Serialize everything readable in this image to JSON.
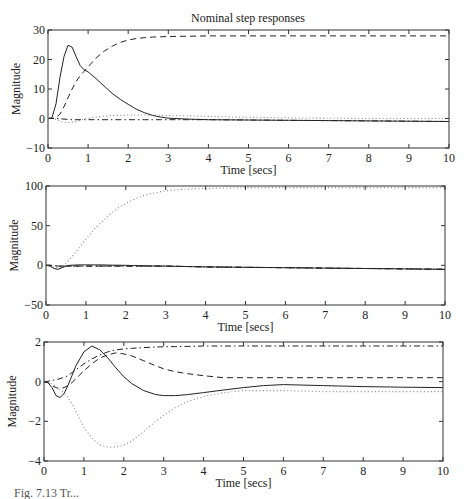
{
  "figure": {
    "title": "Nominal step responses",
    "caption_fragment": "Fig. 7.13  Tr..."
  },
  "colors": {
    "line": "#222222",
    "axis": "#333333",
    "dotted": "#888888"
  },
  "chart_data": [
    {
      "type": "line",
      "title": "Nominal step responses",
      "xlabel": "Time [secs]",
      "ylabel": "Magnitude",
      "xlim": [
        0,
        10
      ],
      "ylim": [
        -10,
        30
      ],
      "xticks": [
        0,
        1,
        2,
        3,
        4,
        5,
        6,
        7,
        8,
        9,
        10
      ],
      "yticks": [
        -10,
        0,
        10,
        20,
        30
      ],
      "grid": false,
      "box": {
        "left": 48,
        "top": 30,
        "right": 449,
        "bottom": 148
      },
      "x": [
        0,
        0.1,
        0.2,
        0.3,
        0.4,
        0.5,
        0.6,
        0.7,
        0.8,
        0.9,
        1.0,
        1.2,
        1.4,
        1.6,
        1.8,
        2.0,
        2.2,
        2.4,
        2.6,
        2.8,
        3.0,
        3.5,
        4,
        5,
        6,
        7,
        8,
        9,
        10
      ],
      "series": [
        {
          "name": "solid",
          "style": "solid",
          "values": [
            0,
            0.3,
            5,
            14,
            21,
            24.8,
            24.2,
            21,
            18,
            16.5,
            15.8,
            13.5,
            11,
            8.5,
            6.5,
            4.8,
            3.2,
            2,
            1.1,
            0.5,
            0.1,
            -0.2,
            -0.4,
            -0.5,
            -0.6,
            -0.7,
            -0.8,
            -0.9,
            -1
          ]
        },
        {
          "name": "dashed",
          "style": "dashed",
          "values": [
            0,
            0,
            0.3,
            1.5,
            4,
            7,
            10,
            12.5,
            14.5,
            16,
            17.5,
            20.5,
            22.8,
            24.5,
            25.8,
            26.6,
            27.1,
            27.4,
            27.6,
            27.7,
            27.8,
            27.9,
            28,
            28,
            28,
            28,
            28,
            28,
            28
          ]
        },
        {
          "name": "dotted",
          "style": "dotted",
          "values": [
            0,
            0,
            -0.3,
            -0.8,
            -1.3,
            -1.4,
            -1.3,
            -1,
            -0.6,
            -0.2,
            0.1,
            0.5,
            0.8,
            1,
            1.1,
            1.2,
            1.2,
            1.2,
            1.1,
            1.1,
            1,
            0.9,
            0.7,
            0.4,
            0.2,
            0.1,
            0,
            0,
            0
          ]
        },
        {
          "name": "dashdot",
          "style": "dashdot",
          "values": [
            0,
            0,
            0,
            -0.1,
            -0.2,
            -0.3,
            -0.4,
            -0.4,
            -0.4,
            -0.4,
            -0.4,
            -0.4,
            -0.4,
            -0.4,
            -0.4,
            -0.4,
            -0.4,
            -0.4,
            -0.4,
            -0.4,
            -0.4,
            -0.4,
            -0.4,
            -0.5,
            -0.6,
            -0.7,
            -0.8,
            -0.9,
            -1
          ]
        }
      ]
    },
    {
      "type": "line",
      "title": "",
      "xlabel": "Time [secs]",
      "ylabel": "Magnitude",
      "xlim": [
        0,
        10
      ],
      "ylim": [
        -50,
        100
      ],
      "xticks": [
        0,
        1,
        2,
        3,
        4,
        5,
        6,
        7,
        8,
        9,
        10
      ],
      "yticks": [
        -50,
        0,
        50,
        100
      ],
      "grid": false,
      "box": {
        "left": 46,
        "top": 186,
        "right": 445,
        "bottom": 305
      },
      "x": [
        0,
        0.1,
        0.2,
        0.3,
        0.4,
        0.5,
        0.6,
        0.8,
        1.0,
        1.2,
        1.4,
        1.6,
        1.8,
        2.0,
        2.2,
        2.4,
        2.6,
        2.8,
        3.0,
        3.5,
        4,
        5,
        6,
        7,
        8,
        9,
        10
      ],
      "series": [
        {
          "name": "solid",
          "style": "solid",
          "values": [
            0,
            -1,
            -4,
            -5,
            -3,
            -1,
            0,
            0.5,
            0.5,
            0.5,
            0.5,
            0.3,
            0.2,
            0,
            -0.3,
            -0.5,
            -0.7,
            -0.9,
            -1,
            -1.5,
            -2,
            -2.5,
            -3,
            -3.5,
            -4,
            -4.5,
            -5
          ]
        },
        {
          "name": "dashed",
          "style": "dashed",
          "values": [
            0,
            0,
            -0.5,
            -1,
            -1,
            -1,
            -1,
            -1,
            -1,
            -1,
            -1,
            -1,
            -1,
            -1,
            -1,
            -1,
            -1,
            -1,
            -1,
            -1.5,
            -2,
            -2.5,
            -3,
            -3.5,
            -4,
            -4.5,
            -5
          ]
        },
        {
          "name": "dotted",
          "style": "dotted",
          "values": [
            0,
            0,
            -2,
            -3,
            -2,
            2,
            8,
            20,
            33,
            45,
            55,
            64,
            72,
            78,
            83,
            87,
            90,
            92,
            94,
            96,
            97,
            98,
            98,
            98,
            98,
            98,
            98
          ]
        },
        {
          "name": "dashdot",
          "style": "dashdot",
          "values": [
            0,
            0,
            -0.5,
            -1,
            -1,
            -1,
            -1,
            -1,
            -1,
            -1,
            -1,
            -1,
            -1,
            -1,
            -1,
            -1,
            -1,
            -1,
            -1,
            -1.5,
            -2,
            -2.5,
            -3,
            -3.5,
            -4,
            -4.5,
            -5
          ]
        }
      ]
    },
    {
      "type": "line",
      "title": "",
      "xlabel": "Time [secs]",
      "ylabel": "Magnitude",
      "xlim": [
        0,
        10
      ],
      "ylim": [
        -4,
        2
      ],
      "xticks": [
        0,
        1,
        2,
        3,
        4,
        5,
        6,
        7,
        8,
        9,
        10
      ],
      "yticks": [
        -4,
        -2,
        0,
        2
      ],
      "grid": false,
      "box": {
        "left": 44,
        "top": 342,
        "right": 443,
        "bottom": 461
      },
      "x": [
        0,
        0.1,
        0.2,
        0.3,
        0.4,
        0.5,
        0.6,
        0.7,
        0.8,
        1.0,
        1.2,
        1.4,
        1.6,
        1.8,
        2.0,
        2.2,
        2.5,
        2.8,
        3.0,
        3.3,
        3.6,
        4,
        4.5,
        5,
        5.5,
        6,
        7,
        8,
        9,
        10
      ],
      "series": [
        {
          "name": "solid",
          "style": "solid",
          "values": [
            0,
            -0.05,
            -0.3,
            -0.7,
            -0.8,
            -0.6,
            -0.2,
            0.3,
            0.8,
            1.5,
            1.8,
            1.6,
            1.2,
            0.7,
            0.25,
            -0.1,
            -0.45,
            -0.65,
            -0.7,
            -0.7,
            -0.65,
            -0.55,
            -0.42,
            -0.3,
            -0.2,
            -0.15,
            -0.2,
            -0.25,
            -0.28,
            -0.3
          ]
        },
        {
          "name": "dashed",
          "style": "dashed",
          "values": [
            0,
            -0.05,
            -0.2,
            -0.3,
            -0.35,
            -0.3,
            -0.2,
            -0.05,
            0.15,
            0.55,
            0.9,
            1.2,
            1.35,
            1.45,
            1.4,
            1.3,
            1.05,
            0.8,
            0.65,
            0.5,
            0.4,
            0.3,
            0.2,
            0.2,
            0.2,
            0.2,
            0.2,
            0.2,
            0.2,
            0.2
          ]
        },
        {
          "name": "dotted",
          "style": "dotted",
          "values": [
            0,
            -0.02,
            -0.1,
            -0.25,
            -0.4,
            -0.55,
            -0.8,
            -1.1,
            -1.5,
            -2.3,
            -2.85,
            -3.2,
            -3.3,
            -3.3,
            -3.2,
            -3.0,
            -2.5,
            -2.0,
            -1.7,
            -1.3,
            -1.0,
            -0.75,
            -0.55,
            -0.45,
            -0.45,
            -0.45,
            -0.5,
            -0.5,
            -0.5,
            -0.5
          ]
        },
        {
          "name": "dashdot",
          "style": "dashdot",
          "values": [
            0,
            0.02,
            0.06,
            0.1,
            0.15,
            0.22,
            0.3,
            0.45,
            0.6,
            0.9,
            1.15,
            1.35,
            1.5,
            1.6,
            1.65,
            1.68,
            1.72,
            1.75,
            1.76,
            1.77,
            1.78,
            1.8,
            1.8,
            1.8,
            1.8,
            1.8,
            1.8,
            1.8,
            1.8,
            1.8
          ]
        }
      ]
    }
  ]
}
